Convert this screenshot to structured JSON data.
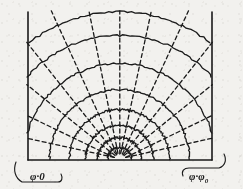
{
  "figure": {
    "kind": "field-map-diagram",
    "background_color": "#f2f1ee",
    "ink_color": "#1a1a1a",
    "canvas": {
      "width": 243,
      "height": 189
    }
  },
  "geometry": {
    "origin": {
      "x": 120,
      "y": 160
    },
    "baseline_y": 160,
    "left_electrode_x": 28,
    "right_electrode_x": 212,
    "electrode_top_y": 12,
    "arc_radii": [
      12,
      22,
      34,
      50,
      70,
      96,
      124,
      148
    ],
    "ray_angles_deg": [
      0,
      13,
      26,
      39,
      52,
      65,
      78,
      90,
      102,
      115,
      128,
      141,
      154,
      167,
      180
    ],
    "solid_line_width": 1.3,
    "dashed_line_width": 1.3,
    "dash_pattern": "4 3"
  },
  "labels": {
    "left": {
      "name": "phi-zero-label",
      "symbol": "φ",
      "separator": "·",
      "value": "0",
      "full_text": "φ·0",
      "x": 30,
      "y": 180
    },
    "right": {
      "name": "phi-phi0-label",
      "symbol": "φ",
      "separator": "·",
      "value": "φ",
      "subscript": "0",
      "full_text": "φ·φ₀",
      "x": 189,
      "y": 180
    }
  },
  "annotations": {
    "left_brace": {
      "name": "left-corner-brace",
      "d": "M 16 162 C 13 170 15 178 22 182 L 58 182 C 62 182 63 178 61 174"
    },
    "right_brace": {
      "name": "right-corner-brace",
      "d": "M 183 176 C 181 171 184 168 189 168 L 219 168 C 225 166 227 160 224 154"
    }
  },
  "colors": {
    "paper": "#f2f1ee",
    "ink": "#1a1a1a",
    "ink_soft": "#2b2a27"
  }
}
